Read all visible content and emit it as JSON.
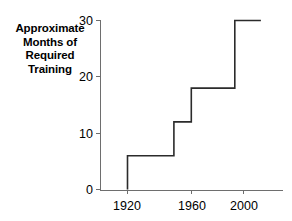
{
  "chart_data": {
    "type": "line",
    "subtype": "step-post",
    "title": "",
    "xlabel": "",
    "ylabel": "Approximate Months of Required Training",
    "ylabel_lines": [
      "Approximate",
      "Months of",
      "Required",
      "Training"
    ],
    "x": [
      1920,
      1952,
      1964,
      1994,
      2012
    ],
    "values": [
      6,
      12,
      18,
      30,
      30
    ],
    "steps": [
      {
        "x_start": 1920,
        "x_end": 1952,
        "y": 6
      },
      {
        "x_start": 1952,
        "x_end": 1964,
        "y": 12
      },
      {
        "x_start": 1964,
        "x_end": 1994,
        "y": 18
      },
      {
        "x_start": 1994,
        "x_end": 2012,
        "y": 30
      }
    ],
    "xlim": [
      1902,
      2030
    ],
    "ylim": [
      0,
      30
    ],
    "xticks": [
      1920,
      1960,
      2000
    ],
    "xticklabels": [
      "1920",
      "1960",
      "2000"
    ],
    "yticks": [
      0,
      10,
      20,
      30
    ],
    "yticklabels": [
      "0",
      "10",
      "20",
      "30"
    ],
    "grid": false,
    "legend": null,
    "line_color": "#2b2b2b",
    "axis_color": "#6e6e6e",
    "text_color": "#000000",
    "background": "#ffffff"
  },
  "axis": {
    "y_label_line1": "Approximate",
    "y_label_line2": "Months of",
    "y_label_line3": "Required",
    "y_label_line4": "Training",
    "ytick_0": "0",
    "ytick_1": "10",
    "ytick_2": "20",
    "ytick_3": "30",
    "xtick_0": "1920",
    "xtick_1": "1960",
    "xtick_2": "2000"
  }
}
